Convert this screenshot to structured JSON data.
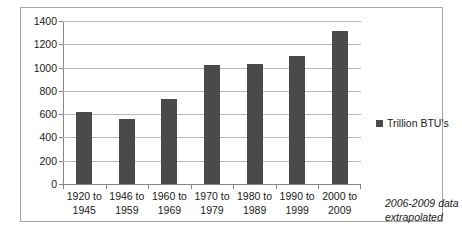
{
  "chart_data": {
    "type": "bar",
    "title": "",
    "xlabel": "",
    "ylabel": "",
    "categories": [
      "1920 to 1945",
      "1946 to 1959",
      "1960 to 1969",
      "1970 to 1979",
      "1980 to 1989",
      "1990 to 1999",
      "2000 to 2009"
    ],
    "category_lines": [
      [
        "1920 to",
        "1945"
      ],
      [
        "1946 to",
        "1959"
      ],
      [
        "1960 to",
        "1969"
      ],
      [
        "1970 to",
        "1979"
      ],
      [
        "1980 to",
        "1989"
      ],
      [
        "1990 to",
        "1999"
      ],
      [
        "2000 to",
        "2009"
      ]
    ],
    "values": [
      620,
      560,
      730,
      1020,
      1030,
      1100,
      1310
    ],
    "series": [
      {
        "name": "Trillion BTU's",
        "values": [
          620,
          560,
          730,
          1020,
          1030,
          1100,
          1310
        ],
        "color": "#4a4a4a"
      }
    ],
    "ylim": [
      0,
      1400
    ],
    "yticks": [
      0,
      200,
      400,
      600,
      800,
      1000,
      1200,
      1400
    ],
    "ytick_labels": [
      "0",
      "200",
      "400",
      "600",
      "800",
      "1000",
      "1200",
      "1400"
    ],
    "grid": true,
    "legend_position": "right",
    "legend_entries": [
      "Trillion BTU's"
    ],
    "annotations": [
      "2006-2009 data extrapolated"
    ]
  },
  "legend": {
    "label": "Trillion BTU's"
  },
  "note": {
    "line1": "2006-2009 data",
    "line2": "extrapolated"
  },
  "colors": {
    "bar": "#4a4a4a",
    "gridline": "#b7b7b7",
    "axis": "#868686",
    "frame": "#a6a6a6",
    "text": "#1a1a1a"
  }
}
